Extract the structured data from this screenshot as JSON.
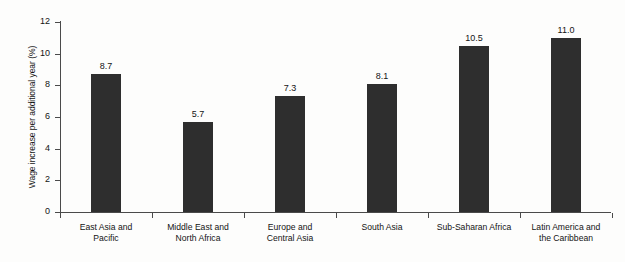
{
  "chart_data": {
    "type": "bar",
    "title": "",
    "subtitle": "",
    "xlabel": "",
    "ylabel": "Wage increase per additional year (%)",
    "ylim": [
      0,
      12
    ],
    "ytick_labels": [
      "0",
      "2",
      "4",
      "6",
      "8",
      "10",
      "12"
    ],
    "ytick_values": [
      0,
      2,
      4,
      6,
      8,
      10,
      12
    ],
    "grid": false,
    "legend": "none",
    "bar_color": "#2e2e2e",
    "axis_color": "#4a4a4a",
    "categories": [
      "East Asia and Pacific",
      "Middle East and North Africa",
      "Europe and Central Asia",
      "South Asia",
      "Sub-Saharan Africa",
      "Latin America and the Caribbean"
    ],
    "category_lines": [
      [
        "East Asia and",
        "Pacific"
      ],
      [
        "Middle East and",
        "North Africa"
      ],
      [
        "Europe and",
        "Central Asia"
      ],
      [
        "South Asia"
      ],
      [
        "Sub-Saharan Africa"
      ],
      [
        "Latin America and",
        "the Caribbean"
      ]
    ],
    "values": [
      8.7,
      5.7,
      7.3,
      8.1,
      10.5,
      11.0
    ],
    "value_labels": [
      "8.7",
      "5.7",
      "7.3",
      "8.1",
      "10.5",
      "11.0"
    ]
  }
}
